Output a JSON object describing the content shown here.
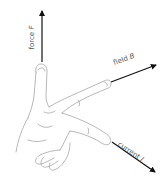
{
  "diagram": {
    "title": "",
    "colors": {
      "arrow": "#111111",
      "outline": "#9a9a9a",
      "label": "#555555",
      "background": "#ffffff"
    },
    "arrows": [
      {
        "id": "force",
        "label": "force",
        "symbol": "F",
        "direction": "up"
      },
      {
        "id": "field",
        "label": "field",
        "symbol": "B",
        "direction": "right"
      },
      {
        "id": "current",
        "label": "current",
        "symbol": "I",
        "direction": "down-right"
      }
    ]
  }
}
